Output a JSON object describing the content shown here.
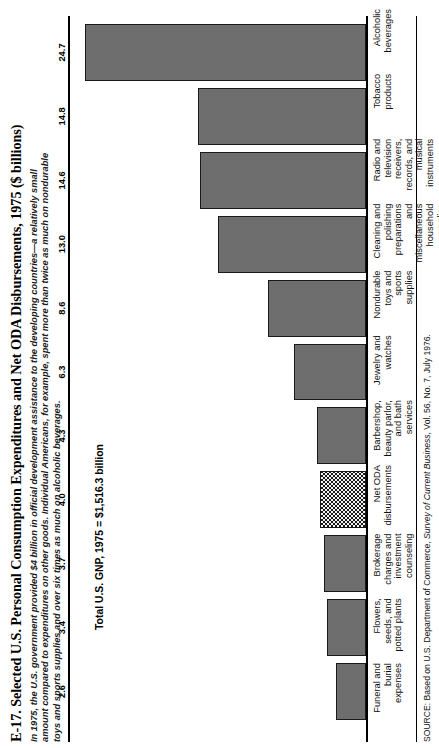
{
  "figure": {
    "title": "E-17. Selected U.S. Personal Consumption Expenditures and Net ODA Disbursements, 1975 ($ billions)",
    "subtitle_line1": "In 1975, the U.S. government provided $4 billion in official development assistance to the developing countries—a relatively small",
    "subtitle_line2": "amount compared to expenditures on other goods. Individual Americans, for example, spent more than twice as much on nondurable",
    "subtitle_line3": "toys and sports supplies and over six times as much on alcoholic beverages.",
    "gnp_note": "Total U.S. GNP, 1975 = $1,516.3 billion",
    "source_prefix": "SOURCE: Based on U.S. Department of Commerce, ",
    "source_italic": "Survey of Current Business",
    "source_suffix": ", Vol. 56, No. 7, July 1976."
  },
  "chart_data": {
    "type": "bar",
    "title": "E-17. Selected U.S. Personal Consumption Expenditures and Net ODA Disbursements, 1975 ($ billions)",
    "xlabel": "",
    "ylabel": "$ billions",
    "ylim": [
      0,
      26
    ],
    "grid": false,
    "legend": "none",
    "orientation": "vertical",
    "value_labels": true,
    "categories": [
      "Funeral and burial expenses",
      "Flowers, seeds, and potted plants",
      "Brokerage charges and investment counseling",
      "Net ODA disbursements",
      "Barbershop, beauty parlor, and bath services",
      "Jewelry and watches",
      "Nondurable toys and sports supplies",
      "Cleaning and polishing preparations\nand miscellaneous household supplies",
      "Radio and television receivers,\nrecords, and musical instruments",
      "Tobacco products",
      "Alcoholic beverages"
    ],
    "values": [
      2.6,
      3.4,
      3.7,
      4.0,
      4.3,
      6.3,
      8.6,
      13.0,
      14.6,
      14.8,
      24.7
    ],
    "value_text": [
      "2.6",
      "3.4",
      "3.7",
      "4.0",
      "4.3",
      "6.3",
      "8.6",
      "13.0",
      "14.6",
      "14.8",
      "24.7"
    ],
    "highlighted_index": 3,
    "bar_fill": "#6e6e6e",
    "bar_outline": "#1a1a1a",
    "highlight_pattern": "checkered",
    "annotations": [
      "Total U.S. GNP, 1975 = $1,516.3 billion"
    ]
  }
}
